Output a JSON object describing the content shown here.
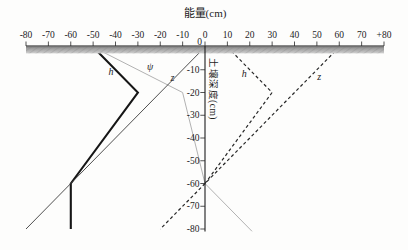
{
  "chart_data": {
    "type": "line",
    "title": "能量(cm)",
    "ylabel": "土壤深度(cm)",
    "x_axis": {
      "min": -80,
      "max": 80,
      "tick_step": 10,
      "labels": [
        "-80",
        "-70",
        "-60",
        "-50",
        "-40",
        "-30",
        "-20",
        "-10",
        "0",
        "10",
        "20",
        "30",
        "40",
        "50",
        "60",
        "70",
        "+80"
      ]
    },
    "y_axis": {
      "min": -80,
      "max": 0,
      "tick_step": 10,
      "labels": [
        "0",
        "-10",
        "-20",
        "-30",
        "-40",
        "-50",
        "-60",
        "-70",
        "-80"
      ]
    },
    "soil_surface_band": {
      "x_from": -80,
      "x_to": 80,
      "depth": 0
    },
    "series": [
      {
        "name": "h-left",
        "label": "h",
        "style": "solid",
        "color": "#161616",
        "width": 2.1,
        "points": [
          [
            -50,
            0
          ],
          [
            -30,
            -20
          ],
          [
            -60,
            -60
          ],
          [
            -60,
            -80
          ]
        ],
        "label_pos": [
          -42,
          -11
        ]
      },
      {
        "name": "psi-left",
        "label": "ψ",
        "style": "solid",
        "color": "#b2b2b2",
        "width": 1,
        "points": [
          [
            -50,
            0
          ],
          [
            -10,
            -20
          ],
          [
            0,
            -60
          ]
        ],
        "label_pos": [
          -24.5,
          -9
        ]
      },
      {
        "name": "z-left",
        "label": "z",
        "style": "solid",
        "color": "#3c3c3c",
        "width": 0.9,
        "points": [
          [
            0,
            0
          ],
          [
            -80,
            -80
          ]
        ],
        "label_pos": [
          -14.5,
          -13.5
        ]
      },
      {
        "name": "h-below-watertable",
        "label": "",
        "style": "solid",
        "color": "#b2b2b2",
        "width": 1,
        "points": [
          [
            0,
            -60
          ],
          [
            21,
            -81
          ]
        ],
        "label_pos": null
      },
      {
        "name": "h-right",
        "label": "h",
        "style": "dashed",
        "color": "#262626",
        "width": 1.2,
        "points": [
          [
            10,
            0
          ],
          [
            30,
            -20
          ],
          [
            0,
            -60
          ]
        ],
        "label_pos": [
          17.5,
          -12
        ]
      },
      {
        "name": "z-right",
        "label": "z",
        "style": "dashed",
        "color": "#262626",
        "width": 1.2,
        "points": [
          [
            60,
            0
          ],
          [
            0,
            -60
          ],
          [
            -20,
            -80
          ]
        ],
        "label_pos": [
          51,
          -13
        ]
      }
    ],
    "legend": null,
    "grid": false
  }
}
